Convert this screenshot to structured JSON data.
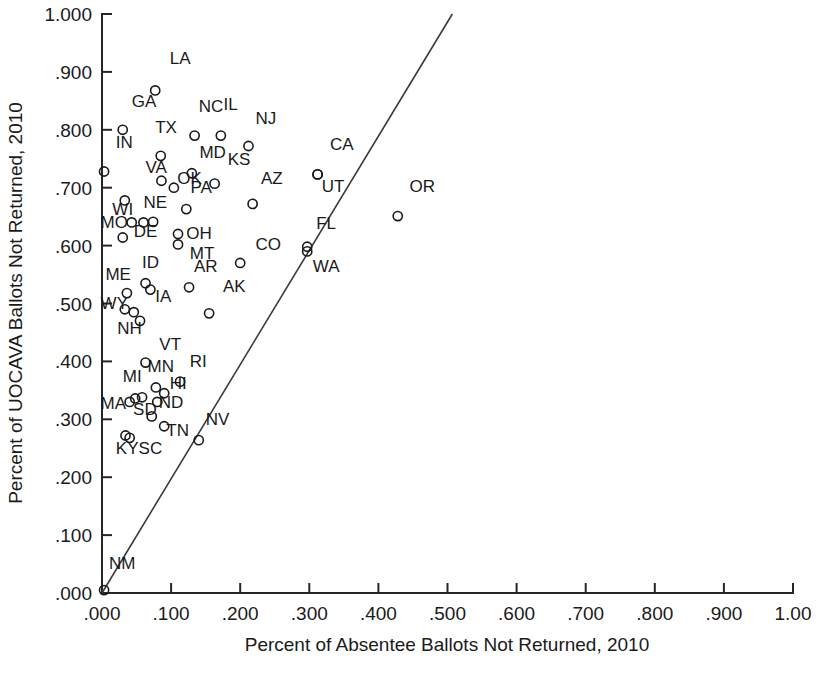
{
  "chart_data": {
    "type": "scatter",
    "title": "",
    "xlabel": "Percent of Absentee Ballots Not Returned, 2010",
    "ylabel": "Percent of UOCAVA Ballots Not Returned, 2010",
    "xlim": [
      0.0,
      1.0
    ],
    "ylim": [
      0.0,
      1.0
    ],
    "grid": false,
    "legend": "none",
    "xticks": [
      ".000",
      ".100",
      ".200",
      ".300",
      ".400",
      ".500",
      ".600",
      ".700",
      ".800",
      ".900",
      "1.00"
    ],
    "xtick_values": [
      0.0,
      0.1,
      0.2,
      0.3,
      0.4,
      0.5,
      0.6,
      0.7,
      0.8,
      0.9,
      1.0
    ],
    "yticks": [
      ".000",
      ".100",
      ".200",
      ".300",
      ".400",
      ".500",
      ".600",
      ".700",
      ".800",
      ".900",
      "1.000"
    ],
    "ytick_values": [
      0.0,
      0.1,
      0.2,
      0.3,
      0.4,
      0.5,
      0.6,
      0.7,
      0.8,
      0.9,
      1.0
    ],
    "reference_line": {
      "name": "45-degree-reference-line",
      "from": [
        0.0,
        0.0
      ],
      "to": [
        0.507,
        1.0
      ]
    },
    "point_label_field": "state",
    "points": [
      {
        "state": "LA",
        "x": 0.077,
        "y": 0.868,
        "lx": 0.098,
        "ly": 0.913
      },
      {
        "state": "GA",
        "x": 0.03,
        "y": 0.8,
        "lx": 0.043,
        "ly": 0.84
      },
      {
        "state": "NC",
        "x": 0.134,
        "y": 0.79,
        "lx": 0.14,
        "ly": 0.831
      },
      {
        "state": "IL",
        "x": 0.172,
        "y": 0.79,
        "lx": 0.176,
        "ly": 0.835
      },
      {
        "state": "NJ",
        "x": 0.212,
        "y": 0.772,
        "lx": 0.222,
        "ly": 0.81
      },
      {
        "state": "TX",
        "x": 0.085,
        "y": 0.755,
        "lx": 0.077,
        "ly": 0.795
      },
      {
        "state": "IN",
        "x": 0.003,
        "y": 0.728,
        "lx": 0.02,
        "ly": 0.768
      },
      {
        "state": "CA",
        "x": 0.312,
        "y": 0.723,
        "lx": 0.33,
        "ly": 0.765
      },
      {
        "state": "UT",
        "x": 0.312,
        "y": 0.723,
        "lx": 0.318,
        "ly": 0.692
      },
      {
        "state": "MD",
        "x": 0.13,
        "y": 0.725,
        "lx": 0.141,
        "ly": 0.752
      },
      {
        "state": "KS",
        "x": 0.163,
        "y": 0.707,
        "lx": 0.182,
        "ly": 0.74
      },
      {
        "state": "VA",
        "x": 0.086,
        "y": 0.712,
        "lx": 0.063,
        "ly": 0.726
      },
      {
        "state": "OK",
        "x": 0.104,
        "y": 0.7,
        "lx": 0.109,
        "ly": 0.707
      },
      {
        "state": "AZ",
        "x": 0.218,
        "y": 0.672,
        "lx": 0.23,
        "ly": 0.707
      },
      {
        "state": "OR",
        "x": 0.428,
        "y": 0.651,
        "lx": 0.445,
        "ly": 0.692
      },
      {
        "state": "PA",
        "x": 0.122,
        "y": 0.663,
        "lx": 0.128,
        "ly": 0.69
      },
      {
        "state": "WI",
        "x": 0.033,
        "y": 0.678,
        "lx": 0.015,
        "ly": 0.652
      },
      {
        "state": "NE",
        "x": 0.074,
        "y": 0.641,
        "lx": 0.06,
        "ly": 0.665
      },
      {
        "state": "MO",
        "x": 0.043,
        "y": 0.64,
        "lx": -0.002,
        "ly": 0.63
      },
      {
        "state": "DE",
        "x": 0.06,
        "y": 0.64,
        "lx": 0.046,
        "ly": 0.614
      },
      {
        "state": "GA2",
        "x": 0.03,
        "y": 0.614,
        "lx": 0.03,
        "ly": 0.614
      },
      {
        "state": "OH",
        "x": 0.11,
        "y": 0.62,
        "lx": 0.122,
        "ly": 0.612
      },
      {
        "state": "FL",
        "x": 0.297,
        "y": 0.598,
        "lx": 0.31,
        "ly": 0.628
      },
      {
        "state": "WA",
        "x": 0.297,
        "y": 0.59,
        "lx": 0.305,
        "ly": 0.555
      },
      {
        "state": "MT",
        "x": 0.11,
        "y": 0.602,
        "lx": 0.127,
        "ly": 0.576
      },
      {
        "state": "CO",
        "x": 0.2,
        "y": 0.57,
        "lx": 0.222,
        "ly": 0.592
      },
      {
        "state": "AR",
        "x": 0.126,
        "y": 0.528,
        "lx": 0.133,
        "ly": 0.555
      },
      {
        "state": "ID",
        "x": 0.063,
        "y": 0.535,
        "lx": 0.058,
        "ly": 0.562
      },
      {
        "state": "ME",
        "x": 0.036,
        "y": 0.518,
        "lx": 0.005,
        "ly": 0.54
      },
      {
        "state": "IA",
        "x": 0.07,
        "y": 0.524,
        "lx": 0.077,
        "ly": 0.502
      },
      {
        "state": "AK",
        "x": 0.155,
        "y": 0.483,
        "lx": 0.175,
        "ly": 0.52
      },
      {
        "state": "WYp",
        "x": 0.033,
        "y": 0.49,
        "lx": 0.033,
        "ly": 0.49
      },
      {
        "state": "WY",
        "x": 0.046,
        "y": 0.485,
        "lx": -0.002,
        "ly": 0.49
      },
      {
        "state": "NH",
        "x": 0.055,
        "y": 0.47,
        "lx": 0.022,
        "ly": 0.448
      },
      {
        "state": "VT",
        "x": 0.063,
        "y": 0.398,
        "lx": 0.083,
        "ly": 0.42
      },
      {
        "state": "RI",
        "x": 0.113,
        "y": 0.365,
        "lx": 0.127,
        "ly": 0.39
      },
      {
        "state": "MN",
        "x": 0.078,
        "y": 0.355,
        "lx": 0.066,
        "ly": 0.382
      },
      {
        "state": "HI",
        "x": 0.09,
        "y": 0.345,
        "lx": 0.098,
        "ly": 0.352
      },
      {
        "state": "MI",
        "x": 0.058,
        "y": 0.338,
        "lx": 0.03,
        "ly": 0.365
      },
      {
        "state": "MIp",
        "x": 0.048,
        "y": 0.336,
        "lx": 0.048,
        "ly": 0.336
      },
      {
        "state": "ND",
        "x": 0.08,
        "y": 0.33,
        "lx": 0.082,
        "ly": 0.32
      },
      {
        "state": "MA",
        "x": 0.04,
        "y": 0.33,
        "lx": -0.002,
        "ly": 0.318
      },
      {
        "state": "SD",
        "x": 0.072,
        "y": 0.305,
        "lx": 0.045,
        "ly": 0.308
      },
      {
        "state": "KY",
        "x": 0.034,
        "y": 0.272,
        "lx": 0.02,
        "ly": 0.24
      },
      {
        "state": "SC",
        "x": 0.04,
        "y": 0.268,
        "lx": 0.053,
        "ly": 0.24
      },
      {
        "state": "TN",
        "x": 0.09,
        "y": 0.288,
        "lx": 0.093,
        "ly": 0.272
      },
      {
        "state": "NV",
        "x": 0.14,
        "y": 0.264,
        "lx": 0.15,
        "ly": 0.29
      },
      {
        "state": "NM",
        "x": 0.003,
        "y": 0.005,
        "lx": 0.01,
        "ly": 0.042
      }
    ],
    "visible_point_labels": [
      "LA",
      "GA",
      "NC",
      "IL",
      "NJ",
      "TX",
      "IN",
      "CA",
      "UT",
      "MD",
      "KS",
      "VA",
      "OK",
      "AZ",
      "OR",
      "PA",
      "WI",
      "NE",
      "MO",
      "DE",
      "OH",
      "FL",
      "WA",
      "MT",
      "CO",
      "AR",
      "ID",
      "ME",
      "IA",
      "AK",
      "WY",
      "NH",
      "VT",
      "RI",
      "MN",
      "HI",
      "MI",
      "ND",
      "MA",
      "SD",
      "KY",
      "SC",
      "TN",
      "NV",
      "NM"
    ]
  },
  "style": {
    "axis_color": "#262626",
    "marker_color": "#1a1a1a",
    "reference_line_color": "#3a3a3a",
    "background": "#ffffff"
  }
}
